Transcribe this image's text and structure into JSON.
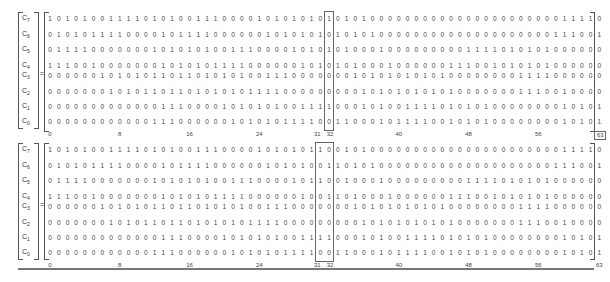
{
  "row_labels": [
    {
      "base": "C",
      "sub": "7"
    },
    {
      "base": "C",
      "sub": "6"
    },
    {
      "base": "C",
      "sub": "5"
    },
    {
      "base": "C",
      "sub": "4"
    },
    {
      "base": "C",
      "sub": "3"
    },
    {
      "base": "C",
      "sub": "2"
    },
    {
      "base": "C",
      "sub": "1"
    },
    {
      "base": "C",
      "sub": "0"
    }
  ],
  "equals_sign": "=",
  "top_matrix": {
    "highlighted_columns": [
      32
    ],
    "rows": [
      "1010100111101010011100001010101010101000000000000000000000011110",
      "0101011110000101111000000101010101010100000000000000000000111001",
      "0111100000001010101001110000101010100010000000001111010101000000",
      "1110010000000101010111100000010101010001000000111001010101000000",
      "0000001010101101101010100111000000010101010101000000001111000000",
      "0000000101011011010101011110000000001010101010100000001110010000",
      "0000000000000111000010101010011110001010011110101010000000010101",
      "0000000000001110000001010101111001100010111100101010000000010101"
    ],
    "tick_labels": [
      {
        "col": 0,
        "text": "0"
      },
      {
        "col": 8,
        "text": "8"
      },
      {
        "col": 16,
        "text": "16"
      },
      {
        "col": 24,
        "text": "24"
      },
      {
        "col": 31,
        "text": "31"
      },
      {
        "col": 32,
        "text": "32"
      },
      {
        "col": 40,
        "text": "40"
      },
      {
        "col": 48,
        "text": "48"
      },
      {
        "col": 56,
        "text": "56"
      },
      {
        "col": 63,
        "text": "63"
      }
    ],
    "boxed_tick": "63"
  },
  "bottom_matrix": {
    "highlighted_columns": [
      31,
      32
    ],
    "rows": [
      "1010100111101010011100001010101100101000000000000000000000011110",
      "0101011110000101111000000101010011010100000000000000000000111001",
      "0111100000001010101001110000101100100010000000001111010101000000",
      "1110010000000101010111100000010011010001000000111001010101000000",
      "0000001010101101101010100111000000010101010101000000001111000000",
      "0000000101011011010101011110000000001010101010100000001110010000",
      "0000000000000111000010101010011110001010011110101010000000010101",
      "0000000000001110000001010101111001100010111100101010000000010101"
    ],
    "tick_labels": [
      {
        "col": 0,
        "text": "0"
      },
      {
        "col": 8,
        "text": "8"
      },
      {
        "col": 16,
        "text": "16"
      },
      {
        "col": 24,
        "text": "24"
      },
      {
        "col": 31,
        "text": "31"
      },
      {
        "col": 32,
        "text": "32"
      },
      {
        "col": 40,
        "text": "40"
      },
      {
        "col": 48,
        "text": "48"
      },
      {
        "col": 56,
        "text": "56"
      },
      {
        "col": 63,
        "text": "63"
      }
    ]
  }
}
